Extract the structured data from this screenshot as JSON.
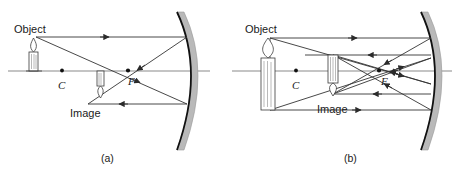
{
  "figure": {
    "type": "optics-ray-diagram",
    "background_color": "#ffffff",
    "ink_color": "#1a1a1a",
    "ray_color": "#3a3a3a",
    "axis_color": "#8a8a8a",
    "mirror_body_color": "#b5b5b5",
    "mirror_edge_color": "#111111",
    "panels": [
      {
        "id": "a",
        "caption": "(a)",
        "caption_x": 101,
        "caption_y": 162,
        "labels": {
          "object": "Object",
          "image": "Image",
          "center": "C",
          "focus": "F"
        },
        "label_positions": {
          "object_x": 14,
          "object_y": 33,
          "image_x": 70,
          "image_y": 117,
          "center_x": 58,
          "center_y": 89,
          "focus_x": 128,
          "focus_y": 85
        },
        "axis": {
          "y": 71,
          "x1": 8,
          "x2": 210
        },
        "points": {
          "C": {
            "x": 62,
            "y": 70.5
          },
          "F": {
            "x": 128,
            "y": 70.5
          }
        },
        "object_candle": {
          "base_x": 34,
          "base_y": 71,
          "top_y": 38,
          "width": 9,
          "inverted": false
        },
        "image_candle": {
          "base_x": 101,
          "base_y": 71,
          "tip_y": 104,
          "width": 7,
          "inverted": true
        },
        "mirror": {
          "vertex_x": 191,
          "vertex_y": 71,
          "top_x": 177,
          "top_y": 12,
          "bottom_x": 177,
          "bottom_y": 150,
          "thickness": 7
        },
        "rays": [
          {
            "name": "parallel-incident-ray",
            "from": [
              36,
              37
            ],
            "to": [
              187,
              37
            ],
            "arrow_at": 0.62
          },
          {
            "name": "reflected-through-focus-ray",
            "from": [
              187,
              37
            ],
            "to": [
              88,
              104
            ],
            "arrow_at": 0.52
          },
          {
            "name": "through-focus-incident-ray",
            "from": [
              36,
              37
            ],
            "to": [
              187,
              104
            ],
            "arrow_at": 0.66
          },
          {
            "name": "reflected-parallel-ray",
            "from": [
              187,
              104
            ],
            "to": [
              88,
              104
            ],
            "arrow_at": 0.55
          }
        ]
      },
      {
        "id": "b",
        "caption": "(b)",
        "caption_x": 344,
        "caption_y": 162,
        "labels": {
          "object": "Object",
          "image": "Image",
          "center": "C",
          "focus": "F"
        },
        "label_positions": {
          "object_x": 245,
          "object_y": 33,
          "image_x": 317,
          "image_y": 113,
          "center_x": 293,
          "center_y": 89,
          "focus_x": 384,
          "focus_y": 85
        },
        "axis": {
          "y": 71,
          "x1": 232,
          "x2": 452
        },
        "points": {
          "C": {
            "x": 296,
            "y": 70.5
          },
          "F": {
            "x": 379,
            "y": 70.5
          }
        },
        "object_candle": {
          "base_x": 268,
          "base_y": 110,
          "top_y": 38,
          "width": 14,
          "inverted": false
        },
        "image_candle": {
          "base_x": 333,
          "base_y": 55,
          "tip_y": 94,
          "width": 9,
          "inverted": true
        },
        "mirror": {
          "vertex_x": 435,
          "vertex_y": 71,
          "top_x": 421,
          "top_y": 12,
          "bottom_x": 421,
          "bottom_y": 150,
          "thickness": 7
        },
        "rays": [
          {
            "name": "upper-parallel-incident-ray",
            "from": [
              270,
              38
            ],
            "to": [
              431,
              38
            ],
            "arrow_at": 0.55
          },
          {
            "name": "upper-reflected-to-focus-ray",
            "from": [
              431,
              38
            ],
            "to": [
              333,
              94
            ],
            "arrow_at": 0.5
          },
          {
            "name": "upper-oblique-incident-ray",
            "from": [
              270,
              38
            ],
            "to": [
              431,
              84
            ],
            "arrow_at": 0.55
          },
          {
            "name": "upper-oblique-reflected-ray",
            "from": [
              431,
              84
            ],
            "to": [
              333,
              55
            ],
            "arrow_at": 0.52
          },
          {
            "name": "mid-parallel-ray",
            "from": [
              305,
              55
            ],
            "to": [
              431,
              55
            ],
            "arrow_at": 0.5
          },
          {
            "name": "lower-parallel-incident-ray",
            "from": [
              270,
              110
            ],
            "to": [
              431,
              110
            ],
            "arrow_at": 0.55
          },
          {
            "name": "lower-reflected-to-focus-ray",
            "from": [
              431,
              110
            ],
            "to": [
              333,
              55
            ],
            "arrow_at": 0.5
          },
          {
            "name": "lower-oblique-incident-ray",
            "from": [
              270,
              110
            ],
            "to": [
              431,
              58
            ],
            "arrow_at": 0.55
          },
          {
            "name": "lower-oblique-reflected-ray",
            "from": [
              431,
              58
            ],
            "to": [
              333,
              94
            ],
            "arrow_at": 0.52
          },
          {
            "name": "mid-return-ray",
            "from": [
              431,
              94
            ],
            "to": [
              333,
              94
            ],
            "arrow_at": 0.5
          }
        ]
      }
    ]
  }
}
